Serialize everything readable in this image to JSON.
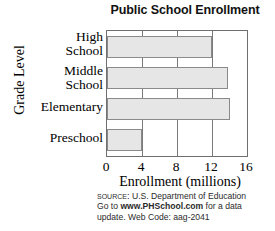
{
  "chart_data": {
    "type": "bar",
    "orientation": "horizontal",
    "title": "Public School Enrollment",
    "xlabel": "Enrollment (millions)",
    "ylabel": "Grade Level",
    "categories": [
      "High School",
      "Middle School",
      "Elementary",
      "Preschool"
    ],
    "values": [
      12,
      13.8,
      14,
      4
    ],
    "xticks": [
      "0",
      "4",
      "8",
      "12",
      "16"
    ],
    "xtick_values": [
      0,
      4,
      8,
      12,
      16
    ],
    "xlim": [
      0,
      16
    ],
    "grid": true,
    "grid_axis": "x",
    "legend": false,
    "bar_fill_color": "#e6e6e6",
    "bar_border_color": "#8a8a8a",
    "axis_color": "#6f6f6f"
  },
  "category_labels": [
    {
      "line1": "High",
      "line2": "School"
    },
    {
      "line1": "Middle",
      "line2": "School"
    },
    {
      "line1": "Elementary",
      "line2": ""
    },
    {
      "line1": "Preschool",
      "line2": ""
    }
  ],
  "footnote": {
    "source_word": "Source:",
    "source_text": "U.S. Department of Education",
    "goto_prefix": "Go to",
    "url": "www.PHSchool.com",
    "goto_suffix": "for a data",
    "update_text": "update. Web Code:",
    "web_code": "aag-2041"
  }
}
